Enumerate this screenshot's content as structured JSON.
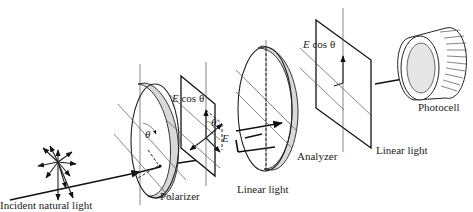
{
  "diagram": {
    "labels": {
      "incident": "Incident natural light",
      "polarizer": "Polarizer",
      "linear1": "Linear light",
      "analyzer": "Analyzer",
      "linear2": "Linear light",
      "photocell": "Photocell",
      "ecos1_e": "E",
      "ecos1_rest": " cos θ",
      "ecos2_e": "E",
      "ecos2_rest": " cos θ",
      "theta_polarizer": "θ",
      "theta_plate": "θ",
      "e_vector": "E"
    },
    "colors": {
      "ink": "#222222",
      "disk_edge_fill": "#d9d9d9",
      "photocell_face": "#e6e6e6",
      "background": "#ffffff"
    }
  }
}
